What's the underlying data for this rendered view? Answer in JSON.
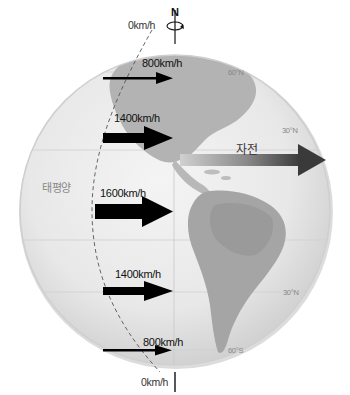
{
  "diagram": {
    "title": "",
    "north_label": "N",
    "pole_speed_top": "0km/h",
    "pole_speed_bottom": "0km/h",
    "ocean_label": "태평양",
    "rotation_label": "자전",
    "speed_arrows": [
      {
        "latitude": "60°N",
        "label": "800km/h",
        "arrow_size": "small"
      },
      {
        "latitude": "30°N",
        "label": "1400km/h",
        "arrow_size": "large"
      },
      {
        "latitude": "0°",
        "label": "1600km/h",
        "arrow_size": "largest"
      },
      {
        "latitude": "30°S",
        "label": "1400km/h",
        "arrow_size": "large"
      },
      {
        "latitude": "60°S",
        "label": "800km/h",
        "arrow_size": "small"
      }
    ],
    "latitude_labels": {
      "lat_60n": "60°N",
      "lat_30n": "30°N",
      "lat_30s": "30°N",
      "lat_60s": "60°S"
    },
    "colors": {
      "arrow": "#000000",
      "rotation_arrow_start": "#c8c8c8",
      "rotation_arrow_end": "#3a3a3a",
      "globe_land": "#a9a9a9",
      "globe_ocean": "#ececec",
      "gridline": "#c9c9c9"
    }
  }
}
